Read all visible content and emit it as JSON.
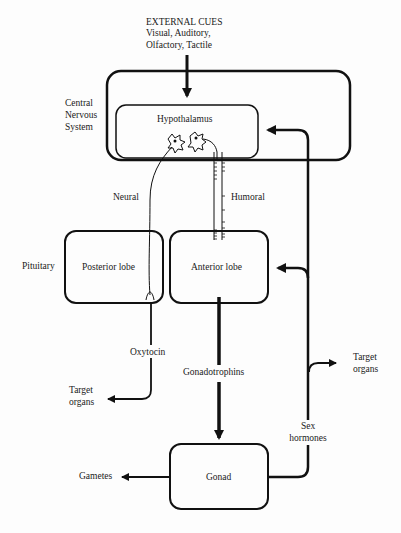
{
  "external_cues": {
    "title": "EXTERNAL CUES",
    "line1": "Visual, Auditory,",
    "line2": "Olfactory, Tactile"
  },
  "cns": {
    "label_line1": "Central",
    "label_line2": "Nervous",
    "label_line3": "System"
  },
  "hypothalamus": {
    "label": "Hypothalamus"
  },
  "pathways": {
    "neural": "Neural",
    "humoral": "Humoral"
  },
  "pituitary": {
    "label": "Pituitary",
    "posterior": "Posterior lobe",
    "anterior": "Anterior lobe"
  },
  "oxytocin": {
    "label": "Oxytocin",
    "target_line1": "Target",
    "target_line2": "organs"
  },
  "gonadotrophins": {
    "label": "Gonadotrophins"
  },
  "gonad": {
    "label": "Gonad",
    "gametes": "Gametes"
  },
  "sex_hormones": {
    "line1": "Sex",
    "line2": "hormones",
    "target_line1": "Target",
    "target_line2": "organs"
  },
  "colors": {
    "ink": "#111111",
    "background": "#fdfdfd"
  }
}
